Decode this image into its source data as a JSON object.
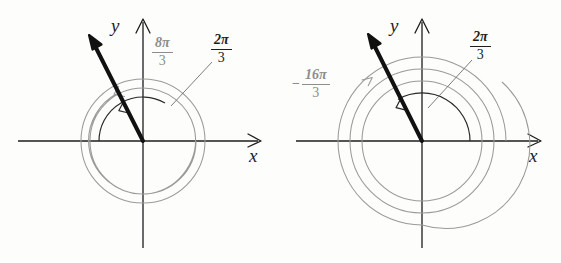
{
  "figure": {
    "background_color": "#fdfdfb",
    "ink_color": "#1d1d1d",
    "gray_color": "#8d8d8d"
  },
  "panels": [
    {
      "id": "left",
      "origin": {
        "x": 143,
        "y": 141
      },
      "axes": {
        "x_label": "x",
        "y_label": "y",
        "x_range": [
          18,
          262
        ],
        "y_range": [
          18,
          248
        ]
      },
      "ray": {
        "angle_deg": 120,
        "tip": {
          "x": 89,
          "y": 35
        },
        "color": "#111111",
        "width": 4
      },
      "circles": [
        {
          "r": 62,
          "color": "#8d8d8d"
        }
      ],
      "arcs": [
        {
          "name": "principal-angle-arc",
          "label": "2π/3",
          "radius": 44,
          "sweep_deg": 120,
          "color": "#1d1d1d",
          "direction": "counterclockwise"
        },
        {
          "name": "coterminal-angle-arc",
          "label": "8π/3",
          "radius": 52,
          "sweep_deg": 480,
          "color": "#8d8d8d",
          "direction": "counterclockwise"
        }
      ],
      "labels": [
        {
          "name": "coterminal-label",
          "numerator": "8π",
          "denominator": "3",
          "sign": "",
          "color": "gray",
          "x": 152,
          "y": 36
        },
        {
          "name": "principal-label",
          "numerator": "2π",
          "denominator": "3",
          "sign": "",
          "color": "black",
          "x": 211,
          "y": 33
        }
      ],
      "leader_line": {
        "x1": 212,
        "y1": 62,
        "x2": 171,
        "y2": 106
      }
    },
    {
      "id": "right",
      "origin": {
        "x": 142,
        "y": 141
      },
      "axes": {
        "x_label": "x",
        "y_label": "y",
        "x_range": [
          16,
          262
        ],
        "y_range": [
          18,
          248
        ]
      },
      "ray": {
        "angle_deg": 120,
        "tip": {
          "x": 88,
          "y": 34
        },
        "color": "#111111",
        "width": 4
      },
      "circles": [
        {
          "r": 60,
          "color": "#8d8d8d"
        },
        {
          "r": 72,
          "color": "#8d8d8d"
        },
        {
          "r": 84,
          "color": "#8d8d8d"
        }
      ],
      "arcs": [
        {
          "name": "principal-angle-arc",
          "label": "2π/3",
          "radius": 48,
          "sweep_deg": 120,
          "color": "#1d1d1d",
          "direction": "counterclockwise"
        },
        {
          "name": "coterminal-angle-arc",
          "label": "-16π/3",
          "radius": 60,
          "sweep_deg": -960,
          "color": "#8d8d8d",
          "direction": "clockwise"
        }
      ],
      "labels": [
        {
          "name": "coterminal-label",
          "numerator": "16π",
          "denominator": "3",
          "sign": "−",
          "color": "gray",
          "x": 12,
          "y": 68
        },
        {
          "name": "principal-label",
          "numerator": "2π",
          "denominator": "3",
          "sign": "",
          "color": "black",
          "x": 190,
          "y": 30
        }
      ],
      "leader_line": {
        "x1": 192,
        "y1": 60,
        "x2": 148,
        "y2": 108
      }
    }
  ]
}
